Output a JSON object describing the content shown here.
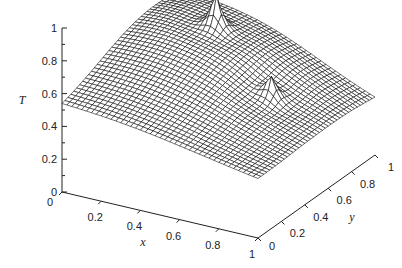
{
  "chart_data": {
    "type": "surface3d",
    "title": "",
    "xlabel": "x",
    "ylabel": "y",
    "zlabel": "T",
    "xlim": [
      0,
      1
    ],
    "ylim": [
      0,
      1
    ],
    "zlim": [
      0,
      1
    ],
    "x_ticks": [
      "0",
      "0.2",
      "0.4",
      "0.6",
      "0.8",
      "1"
    ],
    "y_ticks": [
      "0",
      "0.2",
      "0.4",
      "0.6",
      "0.8",
      "1"
    ],
    "z_ticks": [
      "0",
      "0.2",
      "0.4",
      "0.6",
      "0.8",
      "1"
    ],
    "grid_resolution": 40,
    "surface_description": "Dome-shaped temperature field, T≈0.5 at corner (0,0), rising to ≈0.8 at far corner; two sharp spikes reaching T≈1 (near x≈0.35,y≈0.75) and T≈0.7 (near x≈0.75,y≈0.55)",
    "base_surface": {
      "corner_00": 0.5,
      "corner_10": 0.35,
      "corner_01": 0.55,
      "corner_11": 0.3,
      "peak_center": [
        0.3,
        0.75
      ],
      "peak_value": 0.82
    },
    "spikes": [
      {
        "x": 0.32,
        "y": 0.78,
        "height": 1.0
      },
      {
        "x": 0.72,
        "y": 0.58,
        "height": 0.7
      }
    ]
  }
}
